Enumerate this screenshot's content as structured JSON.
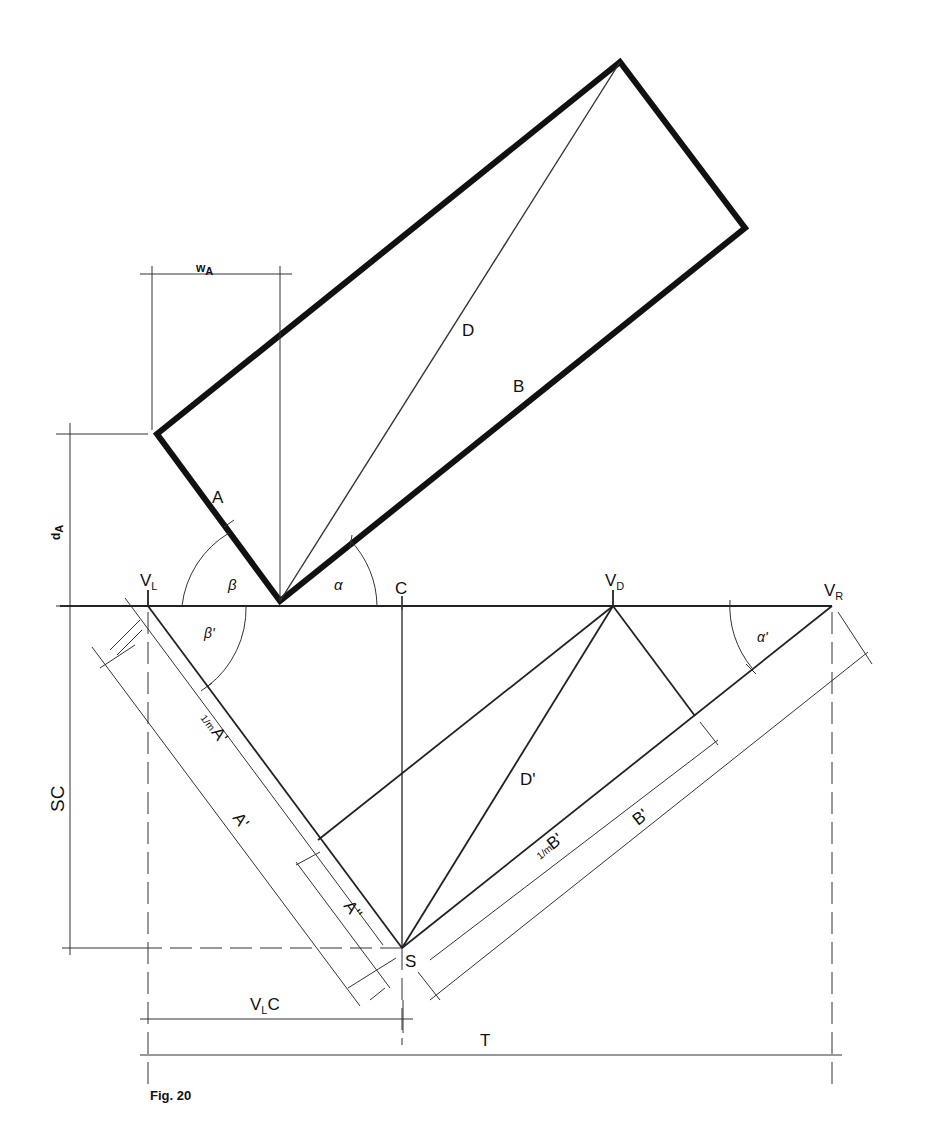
{
  "figure": {
    "caption": "Fig. 20",
    "labels": {
      "w_main": "w",
      "w_sub": "A",
      "d_main": "d",
      "d_sub": "A",
      "A": "A",
      "B": "B",
      "D": "D",
      "beta": "β",
      "alpha": "α",
      "beta_prime": "β'",
      "alpha_prime": "α'",
      "C": "C",
      "VL_main": "V",
      "VL_sub": "L",
      "VD_main": "V",
      "VD_sub": "D",
      "VR_main": "V",
      "VR_sub": "R",
      "D_prime": "D'",
      "A_prime_scaled_frac": "1/m",
      "A_prime_scaled": "A'",
      "A_prime": "A'",
      "A_double_prime": "A''",
      "B_prime_scaled_frac": "1/m",
      "B_prime_scaled": "B'",
      "B_prime": "B'",
      "S": "S",
      "SC": "SC",
      "VLC_main": "V",
      "VLC_sub": "L",
      "VLC_tail": "C",
      "T": "T"
    }
  }
}
